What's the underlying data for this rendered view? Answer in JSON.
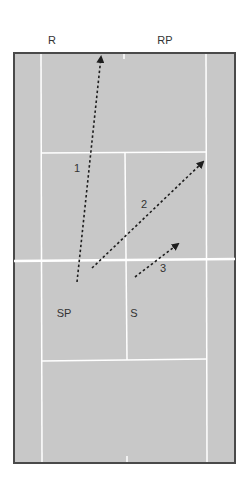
{
  "diagram": {
    "type": "tennis-court",
    "colors": {
      "court": "#c8c8c8",
      "border": "#4a4a4a",
      "lines": "#ffffff",
      "arrows": "#1e1e1e",
      "text": "#333333"
    },
    "player_labels": [
      {
        "id": "R",
        "text": "R",
        "x": 52,
        "y": 40
      },
      {
        "id": "RP",
        "text": "RP",
        "x": 165,
        "y": 40
      },
      {
        "id": "SP",
        "text": "SP",
        "x": 64,
        "y": 313
      },
      {
        "id": "S",
        "text": "S",
        "x": 134,
        "y": 313
      }
    ],
    "shots": [
      {
        "number": "1",
        "label": "1",
        "label_x": 77,
        "label_y": 168,
        "from": [
          77,
          282
        ],
        "to": [
          101,
          56
        ]
      },
      {
        "number": "2",
        "label": "2",
        "label_x": 144,
        "label_y": 204,
        "from": [
          92,
          268
        ],
        "to": [
          204,
          161
        ]
      },
      {
        "number": "3",
        "label": "3",
        "label_x": 163,
        "label_y": 268,
        "from": [
          135,
          277
        ],
        "to": [
          179,
          243
        ]
      }
    ]
  }
}
